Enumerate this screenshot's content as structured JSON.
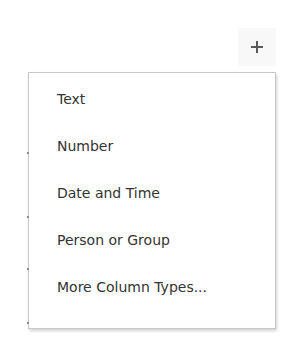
{
  "add_column": {
    "icon": "plus-icon",
    "label": "+"
  },
  "menu": {
    "items": [
      {
        "label": "Text"
      },
      {
        "label": "Number"
      },
      {
        "label": "Date and Time"
      },
      {
        "label": "Person or Group"
      },
      {
        "label": "More Column Types..."
      }
    ]
  },
  "colors": {
    "text": "#333333",
    "border": "#c8c8c8",
    "icon": "#5a5a5a",
    "button_bg": "#f8f8f8"
  }
}
